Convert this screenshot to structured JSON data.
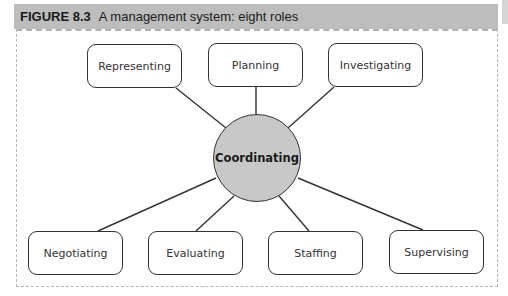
{
  "figure": {
    "number": "FIGURE 8.3",
    "title": "A management system: eight roles"
  },
  "diagram": {
    "center": {
      "label": "Coordinating",
      "fill": "#c8c8c8"
    },
    "top_nodes": [
      {
        "label": "Representing"
      },
      {
        "label": "Planning"
      },
      {
        "label": "Investigating"
      }
    ],
    "bottom_nodes": [
      {
        "label": "Negotiating"
      },
      {
        "label": "Evaluating"
      },
      {
        "label": "Staffing"
      },
      {
        "label": "Supervising"
      }
    ]
  }
}
